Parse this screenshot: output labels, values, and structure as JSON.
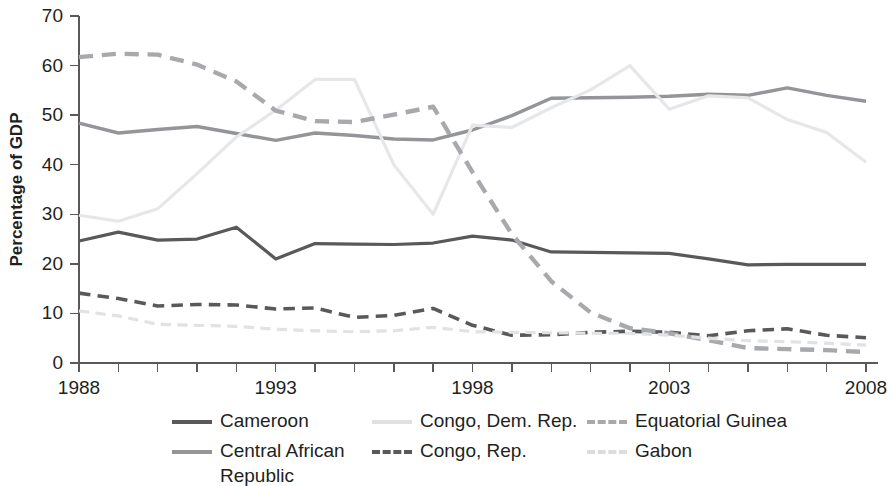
{
  "chart_data": {
    "type": "line",
    "title": "",
    "xlabel": "",
    "ylabel": "Percentage of GDP",
    "xlim": [
      1988,
      2008
    ],
    "ylim": [
      0,
      70
    ],
    "ytick_values": [
      0,
      10,
      20,
      30,
      40,
      50,
      60,
      70
    ],
    "ytick_labels": [
      "0",
      "10",
      "20",
      "30",
      "40",
      "50",
      "60",
      "70"
    ],
    "xtick_values": [
      1988,
      1993,
      1998,
      2003,
      2008
    ],
    "xtick_labels": [
      "1988",
      "1993",
      "1998",
      "2003",
      "2008"
    ],
    "x_minor_tick_step": 1,
    "grid": false,
    "legend_position": "bottom",
    "x": [
      1988,
      1989,
      1990,
      1991,
      1992,
      1993,
      1994,
      1995,
      1996,
      1997,
      1998,
      1999,
      2000,
      2001,
      2002,
      2003,
      2004,
      2005,
      2006,
      2007,
      2008
    ],
    "series": [
      {
        "name": "Cameroon",
        "color": "#58595b",
        "dash": "none",
        "width": 3.2,
        "values": [
          24.6,
          26.4,
          24.8,
          25.0,
          27.4,
          21.0,
          24.1,
          24.0,
          23.9,
          24.2,
          25.6,
          24.8,
          22.4,
          22.3,
          22.2,
          22.1,
          21.0,
          19.8,
          19.9,
          19.9,
          19.9
        ]
      },
      {
        "name": "Central African Republic",
        "color": "#939598",
        "dash": "none",
        "width": 3.4,
        "values": [
          48.4,
          46.4,
          47.1,
          47.7,
          46.3,
          44.9,
          46.4,
          45.9,
          45.2,
          45.0,
          47.0,
          49.9,
          53.4,
          53.5,
          53.6,
          53.8,
          54.2,
          54.0,
          55.5,
          54.0,
          52.8
        ]
      },
      {
        "name": "Congo, Dem. Rep.",
        "color": "#e6e7e8",
        "dash": "none",
        "width": 3.2,
        "values": [
          29.8,
          28.6,
          31.1,
          38.2,
          45.6,
          51.0,
          57.2,
          57.2,
          40.0,
          30.0,
          48.0,
          47.5,
          51.5,
          55.1,
          60.0,
          51.2,
          53.9,
          53.5,
          49.1,
          46.5,
          40.5
        ]
      },
      {
        "name": "Congo, Rep.",
        "color": "#58595b",
        "dash": "dashed",
        "width": 3.6,
        "values": [
          14.1,
          13.0,
          11.5,
          11.8,
          11.7,
          10.9,
          11.1,
          9.2,
          9.6,
          11.0,
          7.6,
          5.6,
          5.7,
          6.2,
          6.4,
          6.2,
          5.5,
          6.5,
          6.9,
          5.6,
          5.1
        ]
      },
      {
        "name": "Equatorial Guinea",
        "color": "#a7a9ac",
        "dash": "dashed",
        "width": 4.4,
        "values": [
          61.7,
          62.4,
          62.2,
          60.2,
          56.8,
          50.9,
          48.8,
          48.6,
          50.1,
          51.7,
          38.5,
          26.0,
          16.5,
          10.2,
          7.0,
          6.0,
          4.6,
          3.0,
          2.8,
          2.6,
          2.2
        ]
      },
      {
        "name": "Gabon",
        "color": "#e1e2e3",
        "dash": "dashed",
        "width": 3.2,
        "values": [
          10.5,
          9.5,
          7.8,
          7.6,
          7.4,
          6.8,
          6.5,
          6.3,
          6.5,
          7.2,
          6.3,
          6.2,
          6.1,
          6.0,
          6.0,
          5.6,
          5.0,
          4.5,
          4.3,
          4.0,
          3.6
        ]
      }
    ]
  },
  "axes": {
    "ylabel": "Percentage of GDP"
  },
  "legend": {
    "items": [
      {
        "label": "Cameroon",
        "color": "#58595b",
        "dash": "none"
      },
      {
        "label": "Congo, Dem. Rep.",
        "color": "#e0e1e2",
        "dash": "none"
      },
      {
        "label": "Equatorial Guinea",
        "color": "#a7a9ac",
        "dash": "dashed"
      },
      {
        "label": "Central African Republic",
        "color": "#939598",
        "dash": "none"
      },
      {
        "label": "Congo, Rep.",
        "color": "#58595b",
        "dash": "dashed"
      },
      {
        "label": "Gabon",
        "color": "#dcdddf",
        "dash": "dashed"
      }
    ]
  }
}
